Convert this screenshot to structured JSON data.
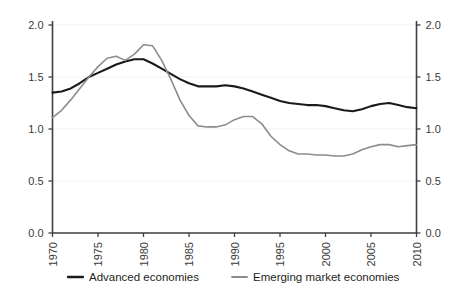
{
  "chart_data": {
    "type": "line",
    "title": "",
    "subtitle": "",
    "xlabel": "",
    "ylabel": "",
    "xlim": [
      1970,
      2010
    ],
    "ylim": [
      0.0,
      2.0
    ],
    "grid": true,
    "legend_position": "bottom",
    "y_ticks": [
      "0.0",
      "0.5",
      "1.0",
      "1.5",
      "2.0"
    ],
    "y_tick_values": [
      0.0,
      0.5,
      1.0,
      1.5,
      2.0
    ],
    "y_axis_right": true,
    "y_ticks_right": [
      "0.0",
      "0.5",
      "1.0",
      "1.5",
      "2.0"
    ],
    "x_ticks": [
      "1970",
      "1975",
      "1980",
      "1985",
      "1990",
      "1995",
      "2000",
      "2005",
      "2010"
    ],
    "x_tick_values": [
      1970,
      1975,
      1980,
      1985,
      1990,
      1995,
      2000,
      2005,
      2010
    ],
    "x": [
      1970,
      1971,
      1972,
      1973,
      1974,
      1975,
      1976,
      1977,
      1978,
      1979,
      1980,
      1981,
      1982,
      1983,
      1984,
      1985,
      1986,
      1987,
      1988,
      1989,
      1990,
      1991,
      1992,
      1993,
      1994,
      1995,
      1996,
      1997,
      1998,
      1999,
      2000,
      2001,
      2002,
      2003,
      2004,
      2005,
      2006,
      2007,
      2008,
      2009,
      2010
    ],
    "series": [
      {
        "name": "Advanced economies",
        "color": "#1a1a1a",
        "values": [
          1.35,
          1.36,
          1.39,
          1.44,
          1.5,
          1.54,
          1.58,
          1.62,
          1.65,
          1.67,
          1.67,
          1.63,
          1.58,
          1.53,
          1.48,
          1.44,
          1.41,
          1.41,
          1.41,
          1.42,
          1.41,
          1.39,
          1.36,
          1.33,
          1.3,
          1.27,
          1.25,
          1.24,
          1.23,
          1.23,
          1.22,
          1.2,
          1.18,
          1.17,
          1.19,
          1.22,
          1.24,
          1.25,
          1.23,
          1.21,
          1.2
        ]
      },
      {
        "name": "Emerging market economies",
        "color": "#8c8c8c",
        "values": [
          1.11,
          1.18,
          1.28,
          1.39,
          1.5,
          1.6,
          1.68,
          1.7,
          1.66,
          1.72,
          1.81,
          1.8,
          1.66,
          1.48,
          1.28,
          1.13,
          1.03,
          1.02,
          1.02,
          1.04,
          1.09,
          1.12,
          1.12,
          1.05,
          0.93,
          0.85,
          0.79,
          0.76,
          0.76,
          0.75,
          0.75,
          0.74,
          0.74,
          0.76,
          0.8,
          0.83,
          0.85,
          0.85,
          0.83,
          0.84,
          0.85
        ]
      }
    ]
  },
  "legend": {
    "items": [
      {
        "label": "Advanced economies",
        "color": "#1a1a1a"
      },
      {
        "label": "Emerging market economies",
        "color": "#8c8c8c"
      }
    ]
  }
}
